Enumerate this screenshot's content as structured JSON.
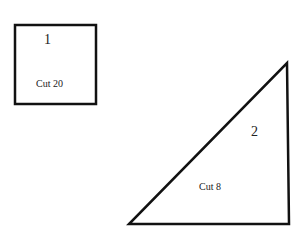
{
  "shapes": [
    {
      "id": 1,
      "type": "square",
      "number": "1",
      "label": "Cut 20"
    },
    {
      "id": 2,
      "type": "right-triangle",
      "number": "2",
      "label": "Cut 8"
    }
  ],
  "colors": {
    "stroke": "#111111",
    "background": "#ffffff"
  }
}
